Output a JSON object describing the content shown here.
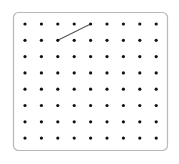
{
  "geoboard": {
    "columns": 9,
    "rows": 8,
    "origin": {
      "x": 25,
      "y": 24
    },
    "spacing": {
      "x": 16.4,
      "y": 16.3
    },
    "frame": {
      "x": 13.5,
      "y": 12.5,
      "width": 154,
      "height": 138,
      "radius": 5,
      "stroke": "#b8b8b8"
    },
    "dot_color": "#111111",
    "dot_radius": 1.6,
    "segments": [
      {
        "from": {
          "col": 2,
          "row": 1
        },
        "to": {
          "col": 4,
          "row": 0
        },
        "color": "#555555"
      }
    ]
  }
}
